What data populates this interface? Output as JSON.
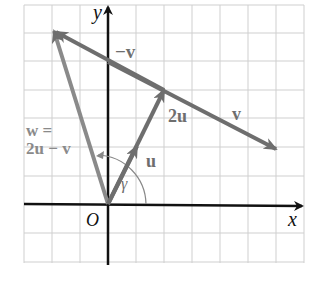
{
  "diagram": {
    "type": "vector-diagram",
    "grid": {
      "x_min": -3,
      "x_max": 7,
      "y_min": -2,
      "y_max": 7,
      "step": 1
    },
    "origin_label": "O",
    "axes": {
      "x_label": "x",
      "y_label": "y"
    },
    "vectors": [
      {
        "name": "u",
        "label": "u",
        "from": [
          0,
          0
        ],
        "to": [
          1,
          2
        ]
      },
      {
        "name": "2u",
        "label": "2u",
        "from": [
          0,
          0
        ],
        "to": [
          2,
          4
        ]
      },
      {
        "name": "v",
        "label": "v",
        "from": [
          2,
          4
        ],
        "to": [
          6,
          2
        ]
      },
      {
        "name": "-v",
        "label": "−v",
        "from": [
          2,
          4
        ],
        "to": [
          -2,
          6
        ]
      },
      {
        "name": "w",
        "label_line1": "w =",
        "label_line2": "2u − v",
        "from": [
          0,
          0
        ],
        "to": [
          -2,
          6
        ]
      }
    ],
    "angle": {
      "label": "γ",
      "between": [
        "u",
        "w"
      ]
    },
    "colors": {
      "axis": "#111111",
      "vector": "#6e6e6e",
      "grid": "#cfcfcf",
      "w_label": "#8a8a8a"
    }
  }
}
